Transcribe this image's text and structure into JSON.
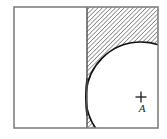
{
  "figure": {
    "type": "technical-geometry-diagram",
    "title": "",
    "canvas": {
      "width": 167,
      "height": 139,
      "background": "#ffffff"
    },
    "frame": {
      "name": "outer-rectangle",
      "x": 14,
      "y": 7,
      "width": 144,
      "height": 121,
      "stroke": "#808080",
      "stroke_width": 1.6,
      "fill": "#ffffff"
    },
    "divider": {
      "name": "vertical-divider-line",
      "x": 87,
      "y1": 7,
      "y2": 128,
      "stroke": "#4d4d4d",
      "stroke_width": 1.4
    },
    "hatched_region": {
      "name": "hatched-area",
      "description": "region right of divider, outside circle",
      "x": 87,
      "y": 7,
      "width": 71,
      "height": 121,
      "pattern": "diagonal-hatch-45",
      "hatch_angle_deg": 45,
      "hatch_spacing": 3.1,
      "hatch_stroke": "#1a1a1a",
      "hatch_stroke_width": 0.85,
      "fill": "#ffffff"
    },
    "circle": {
      "name": "circle-outline",
      "cx": 141,
      "cy": 97,
      "r": 55,
      "stroke": "#111111",
      "stroke_width": 1.7,
      "fill": "#ffffff",
      "tangent_note": "tangent to vertical divider on the left"
    },
    "center_marker": {
      "name": "center-cross-mark",
      "cx": 141,
      "cy": 97,
      "arm": 5.5,
      "stroke": "#1a1a1a",
      "stroke_width": 1.3
    },
    "labels": [
      {
        "name": "point-label-A",
        "text": "A",
        "x": 142,
        "y": 112,
        "style": "italic"
      }
    ],
    "colors": {
      "frame_gray": "#808080",
      "ink_black": "#111111",
      "paper_white": "#ffffff"
    }
  }
}
